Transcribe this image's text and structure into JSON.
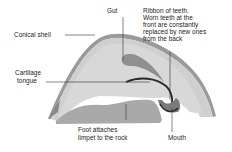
{
  "diagram": {
    "labels": {
      "gut": "Gut",
      "conical_shell": "Conical shell",
      "ribbon_line1": "Ribbon of teeth.",
      "ribbon_line2": "Worn teeth at the",
      "ribbon_line3": "front are constantly",
      "ribbon_line4": "replaced by new ones",
      "ribbon_line5": "from the back",
      "cartilage_line1": "Cartilage",
      "cartilage_line2": "tongue",
      "foot_line1": "Foot attaches",
      "foot_line2": "limpet to the rock",
      "mouth": "Mouth"
    },
    "colors": {
      "body": "#c9c9c9",
      "shell_outline": "#6e6e6e",
      "foot": "#a8a8a8",
      "gut": "#8f8f8f",
      "teeth": "#2a2a2a",
      "line": "#333333"
    }
  }
}
